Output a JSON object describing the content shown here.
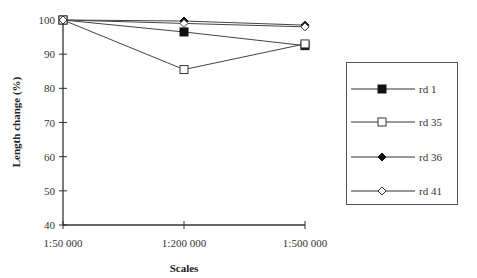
{
  "chart_data": {
    "type": "line",
    "title": "",
    "xlabel": "Scales",
    "ylabel": "Length change (%)",
    "categories": [
      "1:50 000",
      "1:200 000",
      "1:500 000"
    ],
    "ylim": [
      40,
      100
    ],
    "yticks": [
      40,
      50,
      60,
      70,
      80,
      90,
      100
    ],
    "grid": false,
    "legend_position": "right",
    "series": [
      {
        "name": "rd 1",
        "marker": "filled-square",
        "values": [
          100,
          96.5,
          92.5
        ]
      },
      {
        "name": "rd 35",
        "marker": "open-square",
        "values": [
          100,
          85.5,
          93.0
        ]
      },
      {
        "name": "rd 36",
        "marker": "filled-diamond",
        "values": [
          100,
          99.7,
          98.5
        ]
      },
      {
        "name": "rd 41",
        "marker": "open-diamond",
        "values": [
          100,
          99.0,
          98.0
        ]
      }
    ]
  },
  "legend": {
    "items": [
      {
        "label": "rd 1"
      },
      {
        "label": "rd 35"
      },
      {
        "label": "rd 36"
      },
      {
        "label": "rd 41"
      }
    ]
  }
}
